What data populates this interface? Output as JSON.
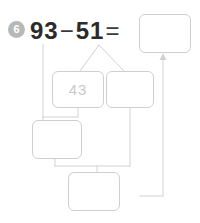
{
  "worksheet": {
    "problem_number": "6",
    "equation": {
      "operand_left": "93",
      "operator": "−",
      "operand_right": "51",
      "equals": "="
    }
  },
  "boxes": {
    "result": {
      "value": "",
      "placeholder": ""
    },
    "split_left": {
      "value": "43",
      "placeholder": ""
    },
    "split_right": {
      "value": "",
      "placeholder": ""
    },
    "step_left": {
      "value": "",
      "placeholder": ""
    },
    "step_bottom": {
      "value": "",
      "placeholder": ""
    }
  },
  "colors": {
    "box_border": "#cfcfcf",
    "connector": "#d0d0d0",
    "text": "#2b2b2b",
    "faded_text": "#c9c9c9",
    "badge_bg": "#b8b8b8",
    "page_bg": "#ffffff"
  },
  "icons": {
    "arrow_up": "arrow-up-icon"
  }
}
